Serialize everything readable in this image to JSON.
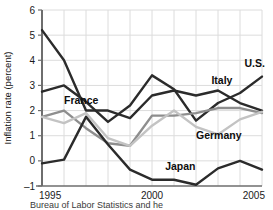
{
  "chart_data": {
    "type": "line",
    "title": "",
    "xlabel": "",
    "ylabel": "Inflation rate (percent)",
    "x": [
      1995,
      1996,
      1997,
      1998,
      1999,
      2000,
      2001,
      2002,
      2003,
      2004,
      2005
    ],
    "xtick_values": [
      1995,
      2000,
      2005
    ],
    "xtick_labels": [
      "1995",
      "2000",
      "2005"
    ],
    "ytick_values": [
      -1,
      0,
      1,
      2,
      3,
      4,
      5,
      6
    ],
    "ytick_labels": [
      "–1",
      "0",
      "1",
      "2",
      "3",
      "4",
      "5",
      "6"
    ],
    "xlim": [
      1995,
      2005
    ],
    "ylim": [
      -1,
      6
    ],
    "grid": true,
    "legend_position": "inline-labels",
    "series": [
      {
        "name": "Italy",
        "color": "#2b2b2b",
        "label": "Italy",
        "values": [
          5.2,
          4.0,
          2.0,
          2.0,
          1.7,
          2.6,
          2.8,
          2.6,
          2.8,
          2.3,
          2.0
        ]
      },
      {
        "name": "U.S.",
        "color": "#2b2b2b",
        "label": "U.S.",
        "values": [
          2.75,
          3.0,
          2.35,
          1.55,
          2.2,
          3.4,
          2.85,
          1.6,
          2.3,
          2.7,
          3.35
        ]
      },
      {
        "name": "France",
        "color": "#8e8e8e",
        "label": "France",
        "values": [
          1.75,
          2.0,
          1.3,
          0.7,
          0.6,
          1.8,
          1.8,
          1.9,
          2.1,
          2.1,
          1.9
        ]
      },
      {
        "name": "Germany",
        "color": "#c3c3c3",
        "label": "Germany",
        "values": [
          1.75,
          1.5,
          1.9,
          0.9,
          0.6,
          1.4,
          2.0,
          1.35,
          1.05,
          1.65,
          1.95
        ]
      },
      {
        "name": "Japan",
        "color": "#2b2b2b",
        "label": "Japan",
        "values": [
          -0.1,
          0.05,
          1.75,
          0.65,
          -0.35,
          -0.75,
          -0.75,
          -0.95,
          -0.3,
          0.0,
          -0.35
        ]
      }
    ],
    "annotations": [
      {
        "text": "France",
        "x": 1996.0,
        "y": 2.25,
        "anchor": "start"
      },
      {
        "text": "Italy",
        "x": 2002.7,
        "y": 3.05,
        "anchor": "start"
      },
      {
        "text": "U.S.",
        "x": 2004.2,
        "y": 3.75,
        "anchor": "start"
      },
      {
        "text": "Germany",
        "x": 2002.0,
        "y": 0.85,
        "anchor": "start"
      },
      {
        "text": "Japan",
        "x": 2000.6,
        "y": -0.35,
        "anchor": "start"
      }
    ]
  },
  "caption": {
    "source_note": "Bureau of Labor Statistics and he"
  },
  "colors": {
    "axis": "#6e6e6e",
    "grid": "#dcdcdc",
    "text": "#111111",
    "dark_series": "#2b2b2b",
    "mid_series": "#8e8e8e",
    "light_series": "#c3c3c3"
  }
}
